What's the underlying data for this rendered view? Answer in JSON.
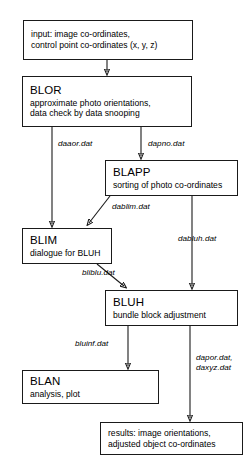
{
  "diagram": {
    "type": "flowchart",
    "nodes": [
      {
        "id": "input",
        "kind": "plain",
        "lines": [
          "input: image co-ordinates,",
          "control point co-ordinates (x, y, z)"
        ]
      },
      {
        "id": "blor",
        "kind": "program",
        "title": "BLOR",
        "desc_lines": [
          "approximate photo orientations,",
          "data check by data snooping"
        ]
      },
      {
        "id": "blapp",
        "kind": "program",
        "title": "BLAPP",
        "desc_lines": [
          "sorting of photo co-ordinates"
        ]
      },
      {
        "id": "blim",
        "kind": "program",
        "title": "BLIM",
        "desc_lines": [
          "dialogue for BLUH"
        ]
      },
      {
        "id": "bluh",
        "kind": "program",
        "title": "BLUH",
        "desc_lines": [
          "bundle block adjustment"
        ]
      },
      {
        "id": "blan",
        "kind": "program",
        "title": "BLAN",
        "desc_lines": [
          "analysis, plot"
        ]
      },
      {
        "id": "results",
        "kind": "plain",
        "lines": [
          "results: image orientations,",
          "adjusted object co-ordinates"
        ]
      }
    ],
    "edges": [
      {
        "id": "e-input-blor",
        "from": "input",
        "to": "blor",
        "label": ""
      },
      {
        "id": "e-blor-blim",
        "from": "blor",
        "to": "blim",
        "label": "daaor.dat"
      },
      {
        "id": "e-blor-blapp",
        "from": "blor",
        "to": "blapp",
        "label": "dapno.dat"
      },
      {
        "id": "e-blapp-blim",
        "from": "blapp",
        "to": "blim",
        "label": "dablim.dat"
      },
      {
        "id": "e-blapp-bluh",
        "from": "blapp",
        "to": "bluh",
        "label": "dabluh.dat"
      },
      {
        "id": "e-blim-bluh",
        "from": "blim",
        "to": "bluh",
        "label": "bliblu.dat"
      },
      {
        "id": "e-bluh-blan",
        "from": "bluh",
        "to": "blan",
        "label": "bluinf.dat"
      },
      {
        "id": "e-bluh-results",
        "from": "bluh",
        "to": "results",
        "label_line1": "dapor.dat,",
        "label_line2": "daxyz.dat"
      }
    ],
    "colors": {
      "stroke": "#1a1a1a",
      "background": "#ffffff",
      "text": "#000000"
    }
  }
}
